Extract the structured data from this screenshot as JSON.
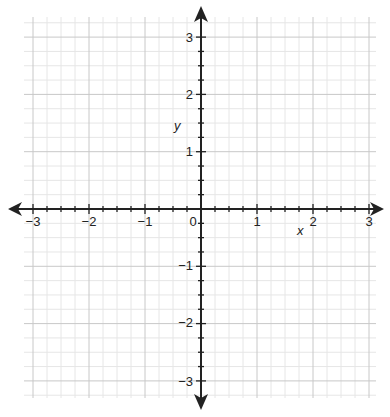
{
  "chart_data": {
    "type": "scatter",
    "title": "",
    "xlabel": "x",
    "ylabel": "y",
    "xlim": [
      -3,
      3
    ],
    "ylim": [
      -3,
      3
    ],
    "x_ticks": [
      "−3",
      "−2",
      "−1",
      "0",
      "1",
      "2",
      "3"
    ],
    "y_ticks": [
      "3",
      "2",
      "1",
      "−1",
      "−2",
      "−3"
    ],
    "origin_label": "0",
    "grid": {
      "on": true,
      "major_step": 1,
      "minor_step": 0.25
    },
    "series": [],
    "legend": null
  },
  "colors": {
    "axis": "#222222",
    "major_grid": "#c8c8c8",
    "minor_grid": "#e6e6e6",
    "background": "#ffffff"
  }
}
